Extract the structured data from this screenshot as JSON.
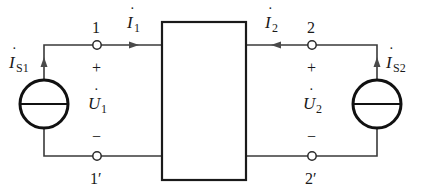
{
  "diagram": {
    "type": "two-port network with current sources",
    "colors": {
      "wire": "#3a3a3a",
      "box": "#1a1a1a",
      "arrow": "#4a4a4a",
      "background": "#ffffff"
    },
    "network_box": {
      "label": ""
    },
    "port1": {
      "top_terminal": "1",
      "bottom_terminal": "1′",
      "voltage": {
        "symbol": "U",
        "subscript": "1",
        "dot": "·"
      },
      "plus": "+",
      "minus": "−",
      "current": {
        "symbol": "I",
        "subscript": "1",
        "dot": "·",
        "direction": "into network (right)"
      },
      "source": {
        "symbol": "I",
        "subscript": "S1",
        "dot": "·",
        "direction": "up"
      }
    },
    "port2": {
      "top_terminal": "2",
      "bottom_terminal": "2′",
      "voltage": {
        "symbol": "U",
        "subscript": "2",
        "dot": "·"
      },
      "plus": "+",
      "minus": "−",
      "current": {
        "symbol": "I",
        "subscript": "2",
        "dot": "·",
        "direction": "into network (left)"
      },
      "source": {
        "symbol": "I",
        "subscript": "S2",
        "dot": "·",
        "direction": "up"
      }
    }
  }
}
